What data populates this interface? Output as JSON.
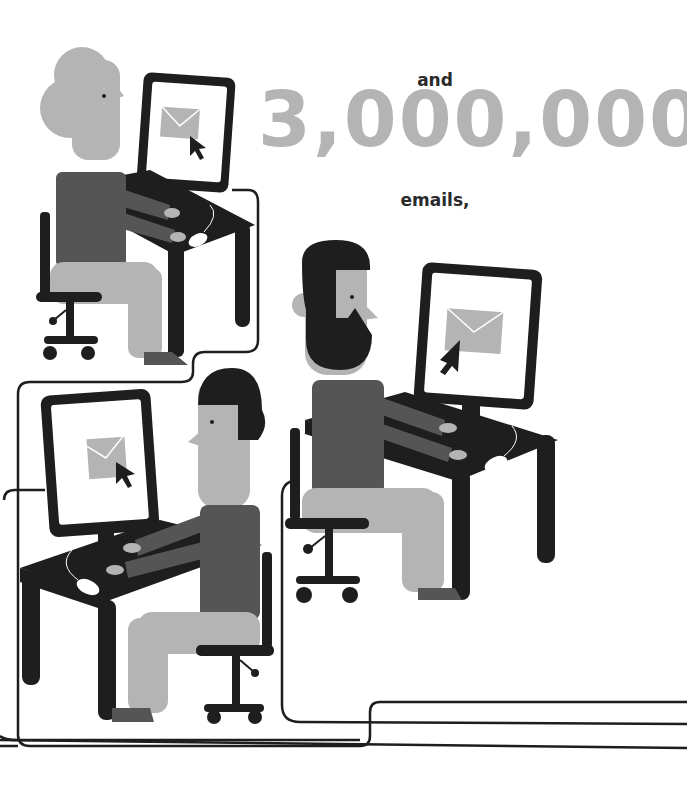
{
  "headline": {
    "prefix": "and",
    "number": "3,000,000",
    "suffix": "emails,"
  },
  "illustration": {
    "description": "Three people seated at desks with computer monitors showing envelope email icons and mouse cursors; monitors connected by cables",
    "workers": [
      {
        "id": "woman-bun",
        "position": "top-left"
      },
      {
        "id": "bearded-man",
        "position": "middle-right"
      },
      {
        "id": "man-short-hair",
        "position": "bottom-left"
      }
    ]
  },
  "colors": {
    "dark": "#1e1e1e",
    "shirt": "#555555",
    "skin_pants": "#b4b4b4",
    "number": "#b4b4b4",
    "text": "#2a2a2a",
    "background": "#ffffff"
  }
}
